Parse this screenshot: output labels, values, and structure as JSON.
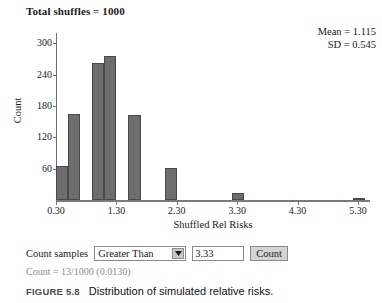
{
  "header": {
    "total_shuffles_label": "Total shuffles = 1000"
  },
  "stats": {
    "mean_label": "Mean = 1.115",
    "sd_label": "SD = 0.545"
  },
  "chart_data": {
    "type": "bar",
    "title": "Total shuffles = 1000",
    "subtitle": "",
    "xlabel": "Shuffled Rel Risks",
    "ylabel": "Count",
    "xlim": [
      0.3,
      5.5
    ],
    "ylim": [
      0,
      320
    ],
    "grid": false,
    "legend": null,
    "bin_width": 0.2,
    "x_ticks": [
      "0.30",
      "1.30",
      "2.30",
      "3.30",
      "4.30",
      "5.30"
    ],
    "x_tick_values": [
      0.3,
      1.3,
      2.3,
      3.3,
      4.3,
      5.3
    ],
    "y_ticks": [
      "60",
      "120",
      "180",
      "240",
      "300"
    ],
    "y_tick_values": [
      60,
      120,
      180,
      240,
      300
    ],
    "bins": [
      {
        "left": 0.3,
        "right": 0.5,
        "value": 66
      },
      {
        "left": 0.5,
        "right": 0.7,
        "value": 165
      },
      {
        "left": 0.9,
        "right": 1.1,
        "value": 262
      },
      {
        "left": 1.1,
        "right": 1.3,
        "value": 275
      },
      {
        "left": 1.5,
        "right": 1.7,
        "value": 163
      },
      {
        "left": 2.1,
        "right": 2.3,
        "value": 62
      },
      {
        "left": 3.22,
        "right": 3.42,
        "value": 13
      },
      {
        "left": 5.22,
        "right": 5.42,
        "value": 3
      }
    ],
    "annotations": [
      "Mean = 1.115",
      "SD = 0.545"
    ],
    "bar_color": "#6e6e6e",
    "bar_edge_color": "#4a4a4a",
    "axis_color": "#7a7a7a"
  },
  "controls": {
    "count_samples_label": "Count samples",
    "comparison_selected": "Greater Than",
    "comparison_options": [
      "Greater Than"
    ],
    "dropdown_icon": "chevron-down-icon",
    "threshold_value": "3.33",
    "threshold_placeholder": "",
    "count_button_label": "Count"
  },
  "result": {
    "count_text": "Count = 13/1000 (0.0130)"
  },
  "caption": {
    "figure_number": "FIGURE 5.8",
    "figure_title": "Distribution of simulated relative risks."
  }
}
